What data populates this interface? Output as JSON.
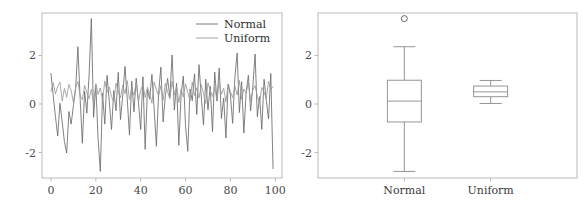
{
  "figure": {
    "width": 585,
    "height": 205,
    "background": "#ffffff"
  },
  "style": {
    "spine_color": "#b9b9b9",
    "tick_color": "#b9b9b9",
    "tick_label_color": "#4a4a4a",
    "normal_color": "#6b6b6b",
    "uniform_color": "#9a9a9a",
    "box_color": "#8a8a8a",
    "median_color": "#8a8a8a",
    "outlier_color": "#555555"
  },
  "chart_data": [
    {
      "id": "line-panel",
      "type": "line",
      "title": "",
      "xlabel": "",
      "ylabel": "",
      "xlim": [
        -4,
        103
      ],
      "ylim": [
        -3.05,
        3.75
      ],
      "grid": false,
      "xticks": [
        0,
        20,
        40,
        60,
        80,
        100
      ],
      "xticklabels": [
        "0",
        "20",
        "40",
        "60",
        "80",
        "100"
      ],
      "yticks": [
        -2,
        0,
        2
      ],
      "yticklabels": [
        "-2",
        "0",
        "2"
      ],
      "legend": {
        "position": "upper right",
        "frame": false,
        "entries": [
          "Normal",
          "Uniform"
        ]
      },
      "x": [
        0,
        1,
        2,
        3,
        4,
        5,
        6,
        7,
        8,
        9,
        10,
        11,
        12,
        13,
        14,
        15,
        16,
        17,
        18,
        19,
        20,
        21,
        22,
        23,
        24,
        25,
        26,
        27,
        28,
        29,
        30,
        31,
        32,
        33,
        34,
        35,
        36,
        37,
        38,
        39,
        40,
        41,
        42,
        43,
        44,
        45,
        46,
        47,
        48,
        49,
        50,
        51,
        52,
        53,
        54,
        55,
        56,
        57,
        58,
        59,
        60,
        61,
        62,
        63,
        64,
        65,
        66,
        67,
        68,
        69,
        70,
        71,
        72,
        73,
        74,
        75,
        76,
        77,
        78,
        79,
        80,
        81,
        82,
        83,
        84,
        85,
        86,
        87,
        88,
        89,
        90,
        91,
        92,
        93,
        94,
        95,
        96,
        97,
        98,
        99
      ],
      "series": [
        {
          "name": "Normal",
          "values": [
            1.26,
            0.34,
            -0.52,
            -1.32,
            0.03,
            -0.74,
            -1.55,
            -2.02,
            -0.31,
            -0.83,
            -0.07,
            0.62,
            2.36,
            0.23,
            -1.62,
            0.52,
            -0.38,
            1.2,
            3.52,
            -0.55,
            0.78,
            -1.42,
            -2.78,
            0.44,
            -0.83,
            1.18,
            0.1,
            -1.05,
            0.55,
            -0.28,
            1.3,
            -0.64,
            0.36,
            1.55,
            0.22,
            -1.28,
            0.94,
            -0.32,
            1.06,
            0.08,
            -1.05,
            1.12,
            -1.87,
            0.58,
            0.2,
            1.22,
            -0.2,
            -1.74,
            0.46,
            1.52,
            -0.74,
            0.35,
            1.05,
            0.28,
            2.02,
            -0.25,
            0.85,
            -1.7,
            0.36,
            1.15,
            -0.92,
            -1.95,
            0.62,
            0.14,
            1.24,
            -0.43,
            1.62,
            0.3,
            -0.86,
            1.02,
            -0.24,
            0.73,
            -1.14,
            1.32,
            0.12,
            1.48,
            -0.6,
            0.24,
            -1.4,
            0.82,
            0.37,
            -0.8,
            1.1,
            2.1,
            -0.35,
            0.92,
            -1.2,
            0.46,
            1.18,
            -0.28,
            0.7,
            2.06,
            -0.52,
            0.3,
            -1.05,
            1.02,
            0.14,
            -0.62,
            1.26,
            -2.66
          ]
        },
        {
          "name": "Uniform",
          "values": [
            0.52,
            0.88,
            0.41,
            0.73,
            0.9,
            0.12,
            0.64,
            0.28,
            0.81,
            0.55,
            0.07,
            0.68,
            0.93,
            0.34,
            0.18,
            0.77,
            0.46,
            0.22,
            0.6,
            0.05,
            0.84,
            0.39,
            0.66,
            0.15,
            0.95,
            0.48,
            0.71,
            0.3,
            0.09,
            0.86,
            0.53,
            0.25,
            0.78,
            0.42,
            0.96,
            0.19,
            0.63,
            0.36,
            0.88,
            0.11,
            0.57,
            0.8,
            0.27,
            0.69,
            0.44,
            0.03,
            0.91,
            0.59,
            0.33,
            0.75,
            0.16,
            0.85,
            0.5,
            0.21,
            0.94,
            0.38,
            0.72,
            0.06,
            0.61,
            0.29,
            0.83,
            0.47,
            0.13,
            0.9,
            0.35,
            0.67,
            0.24,
            0.79,
            0.43,
            0.02,
            0.87,
            0.56,
            0.31,
            0.7,
            0.17,
            0.92,
            0.4,
            0.65,
            0.08,
            0.82,
            0.51,
            0.26,
            0.74,
            0.37,
            0.97,
            0.2,
            0.62,
            0.45,
            0.89,
            0.14,
            0.58,
            0.76,
            0.32,
            0.04,
            0.68,
            0.49,
            0.23,
            0.93,
            0.6,
            0.71
          ]
        }
      ]
    },
    {
      "id": "box-panel",
      "type": "box",
      "title": "",
      "xlabel": "",
      "ylabel": "",
      "ylim": [
        -3.05,
        3.75
      ],
      "grid": false,
      "yticks": [
        -2,
        0,
        2
      ],
      "yticklabels": [
        "-2",
        "0",
        "2"
      ],
      "categories": [
        "Normal",
        "Uniform"
      ],
      "boxes": [
        {
          "name": "Normal",
          "whisker_low": -2.78,
          "q1": -0.74,
          "median": 0.12,
          "q3": 0.98,
          "whisker_high": 2.36,
          "outliers": [
            3.52
          ]
        },
        {
          "name": "Uniform",
          "whisker_low": 0.02,
          "q1": 0.3,
          "median": 0.5,
          "q3": 0.74,
          "whisker_high": 0.97,
          "outliers": []
        }
      ]
    }
  ]
}
